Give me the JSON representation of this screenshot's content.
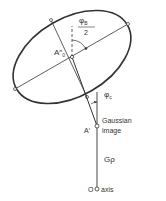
{
  "diagram": {
    "labels": {
      "center_point": "A″",
      "center_point_sub": "0",
      "angle_b_num": "φ",
      "angle_b_num_sub": "B",
      "angle_b_den": "2",
      "angle_c": "φ",
      "angle_c_sub": "c",
      "image_point": "A′",
      "gaussian_line1": "Gaussian",
      "gaussian_line2": "image",
      "distance": "Gρ",
      "origin": "O",
      "axis": "axis"
    },
    "colors": {
      "stroke": "#333333",
      "background": "#ffffff"
    }
  }
}
